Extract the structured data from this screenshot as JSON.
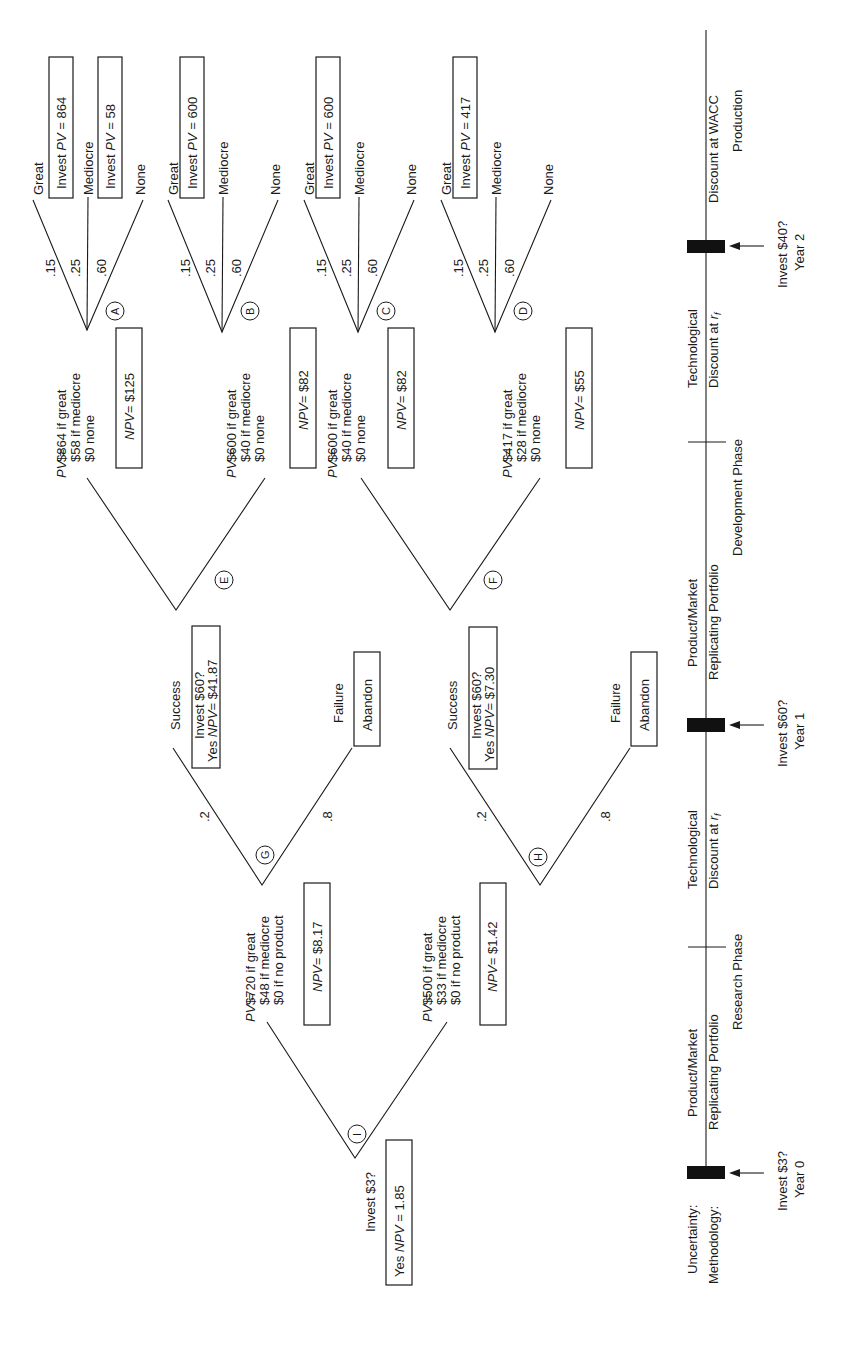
{
  "diagram": {
    "title": "",
    "nodes": {
      "A": {
        "label": "A",
        "probs": [
          ".15",
          ".25",
          ".60"
        ],
        "branches": [
          "Great",
          "Mediocre",
          "None"
        ],
        "great_box": {
          "pre": "Invest ",
          "it": "PV",
          "post": " = 864"
        },
        "mediocre_box": {
          "pre": "Invest ",
          "it": "PV",
          "post": " = 58"
        }
      },
      "B": {
        "label": "B",
        "probs": [
          ".15",
          ".25",
          ".60"
        ],
        "branches": [
          "Great",
          "Mediocre",
          "None"
        ],
        "great_box": {
          "pre": "Invest ",
          "it": "PV",
          "post": " = 600"
        }
      },
      "C": {
        "label": "C",
        "probs": [
          ".15",
          ".25",
          ".60"
        ],
        "branches": [
          "Great",
          "Mediocre",
          "None"
        ],
        "great_box": {
          "pre": "Invest ",
          "it": "PV",
          "post": " = 600"
        }
      },
      "D": {
        "label": "D",
        "probs": [
          ".15",
          ".25",
          ".60"
        ],
        "branches": [
          "Great",
          "Mediocre",
          "None"
        ],
        "great_box": {
          "pre": "Invest ",
          "it": "PV",
          "post": " = 417"
        }
      },
      "E": {
        "label": "E",
        "upper": {
          "pv_label": "PV",
          "pv_eq": " =",
          "lines": [
            "$864 if great",
            "$58 if mediocre",
            "$0 none"
          ],
          "npv": {
            "it": "NPV",
            "post": "= $125"
          }
        },
        "lower": {
          "pv_label": "PV",
          "pv_eq": " =",
          "lines": [
            "$600 if great",
            "$40 if mediocre",
            "$0 none"
          ],
          "npv": {
            "it": "NPV",
            "post": "= $82"
          }
        }
      },
      "F": {
        "label": "F",
        "upper": {
          "pv_label": "PV",
          "pv_eq": " =",
          "lines": [
            "$600 if great",
            "$40 if mediocre",
            "$0 none"
          ],
          "npv": {
            "it": "NPV",
            "post": "= $82"
          }
        },
        "lower": {
          "pv_label": "PV",
          "pv_eq": " =",
          "lines": [
            "$417 if great",
            "$28 if mediocre",
            "$0 none"
          ],
          "npv": {
            "it": "NPV",
            "post": "= $55"
          }
        }
      },
      "G": {
        "label": "G",
        "probs": [
          ".2",
          ".8"
        ],
        "success": {
          "label": "Success",
          "box_line1": "Invest $60?",
          "box_line2_pre": "Yes ",
          "box_line2_it": "NPV",
          "box_line2_post": "= $41.87"
        },
        "failure": {
          "label": "Failure",
          "box": "Abandon"
        }
      },
      "H": {
        "label": "H",
        "probs": [
          ".2",
          ".8"
        ],
        "success": {
          "label": "Success",
          "box_line1": "Invest $60?",
          "box_line2_pre": "Yes ",
          "box_line2_it": "NPV",
          "box_line2_post": "= $7.30"
        },
        "failure": {
          "label": "Failure",
          "box": "Abandon"
        }
      },
      "I": {
        "label": "I",
        "upper": {
          "pv_label": "PV",
          "pv_eq": " =",
          "lines": [
            "$720 if great",
            "$48 if mediocre",
            "$0 if no product"
          ],
          "npv": {
            "it": "NPV",
            "post": "= $8.17"
          }
        },
        "lower": {
          "pv_label": "PV",
          "pv_eq": " =",
          "lines": [
            "$500 if great",
            "$33 if mediocre",
            "$0 if no product"
          ],
          "npv": {
            "it": "NPV",
            "post": "= $1.42"
          }
        },
        "decision": {
          "question": "Invest $3?",
          "box_pre": "Yes ",
          "box_it": "NPV",
          "box_post": " = 1.85"
        }
      }
    },
    "timeline": {
      "row_labels": {
        "uncertainty": "Uncertainty:",
        "methodology": "Methodology:"
      },
      "decision_points": [
        {
          "question": "Invest $3?",
          "year": "Year 0"
        },
        {
          "question": "Invest $60?",
          "year": "Year 1"
        },
        {
          "question": "Invest $40?",
          "year": "Year 2"
        }
      ],
      "segments": [
        {
          "uncertainty": "Product/Market",
          "methodology": "Replicating Portfolio"
        },
        {
          "uncertainty": "Technological",
          "methodology_pre": "Discount at ",
          "methodology_it": "r",
          "methodology_sub": "f"
        },
        {
          "uncertainty": "Product/Market",
          "methodology": "Replicating Portfolio"
        },
        {
          "uncertainty": "Technological",
          "methodology_pre": "Discount at ",
          "methodology_it": "r",
          "methodology_sub": "f"
        },
        {
          "uncertainty": "",
          "methodology": "Discount at WACC"
        }
      ],
      "phases": [
        "Research Phase",
        "Development Phase",
        "Production"
      ]
    }
  }
}
